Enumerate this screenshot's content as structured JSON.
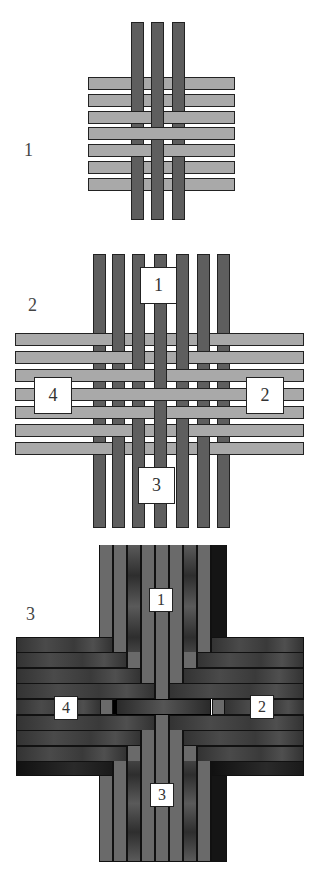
{
  "steps": [
    {
      "label": "1"
    },
    {
      "label": "2",
      "tags": [
        "1",
        "2",
        "3",
        "4"
      ]
    },
    {
      "label": "3",
      "tags": [
        "1",
        "2",
        "3",
        "4"
      ]
    }
  ],
  "colors": {
    "vertical_strip": "#5e5e5e",
    "horizontal_strip": "#a9a9a9",
    "outline": "#222222",
    "finished_mid": "#6a6a6a",
    "finished_dark": "#3a3a3a",
    "finished_black": "#151515"
  }
}
